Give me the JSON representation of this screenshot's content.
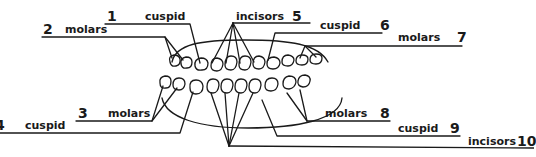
{
  "diagram": {
    "colors": {
      "ink": "#1a1a1a",
      "background": "#ffffff"
    },
    "labels": [
      {
        "number": "1",
        "name": "cuspid"
      },
      {
        "number": "2",
        "name": "molars"
      },
      {
        "number": "3",
        "name": "molars"
      },
      {
        "number": "4",
        "name": "cuspid"
      },
      {
        "number": "5",
        "name": "incisors"
      },
      {
        "number": "6",
        "name": "cuspid"
      },
      {
        "number": "7",
        "name": "molars"
      },
      {
        "number": "8",
        "name": "molars"
      },
      {
        "number": "9",
        "name": "cuspid"
      },
      {
        "number": "10",
        "name": "incisors"
      }
    ]
  }
}
